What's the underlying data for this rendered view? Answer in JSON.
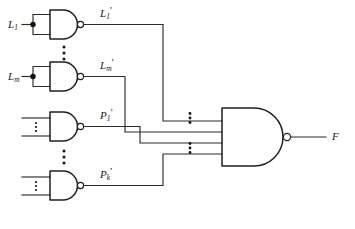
{
  "diagram": {
    "output_label": "F",
    "colors": {
      "wire": "#2b2b2b",
      "gate_outline": "#1f1f1f",
      "background": "#ffffff",
      "text": "#1a1a1a"
    }
  },
  "input_gates": [
    {
      "id": "gate-l1",
      "input_label_base": "L",
      "input_label_sub": "1",
      "input_label_prime": "",
      "output_label_base": "L",
      "output_label_sub": "1",
      "output_label_prime": "'",
      "type": "nand",
      "has_junction_dot": true
    },
    {
      "id": "gate-lm",
      "input_label_base": "L",
      "input_label_sub": "m",
      "input_label_prime": "",
      "output_label_base": "L",
      "output_label_sub": "m",
      "output_label_prime": "'",
      "type": "nand",
      "has_junction_dot": true
    },
    {
      "id": "gate-p1",
      "input_label_base": "",
      "input_label_sub": "",
      "input_label_prime": "",
      "output_label_base": "P",
      "output_label_sub": "1",
      "output_label_prime": "'",
      "type": "nand",
      "has_junction_dot": false
    },
    {
      "id": "gate-pk",
      "input_label_base": "",
      "input_label_sub": "",
      "input_label_prime": "",
      "output_label_base": "P",
      "output_label_sub": "k",
      "output_label_prime": "'",
      "type": "nand",
      "has_junction_dot": false
    }
  ],
  "output_gate": {
    "id": "gate-f",
    "type": "nand",
    "label_base": "F",
    "label_sub": "",
    "label_prime": "",
    "input_count": 4
  },
  "ellipses": [
    {
      "name": "ellipsis-between-l-gates",
      "dots": 3
    },
    {
      "name": "ellipsis-between-p-gates",
      "dots": 3
    },
    {
      "name": "ellipsis-gate-p1-inputs",
      "dots": 3
    },
    {
      "name": "ellipsis-gate-pk-inputs",
      "dots": 3
    },
    {
      "name": "ellipsis-output-gate-upper-inputs",
      "dots": 3
    },
    {
      "name": "ellipsis-output-gate-lower-inputs",
      "dots": 3
    }
  ]
}
